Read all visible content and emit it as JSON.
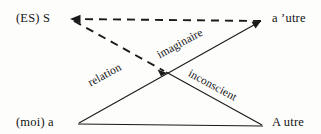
{
  "diagram": {
    "name": "lacan-l-schema",
    "background_color": "#fdfdfc",
    "line_color": "#1a1a1a",
    "vertices": {
      "top_left": "(ES) S",
      "top_right": "a ’utre",
      "bottom_left": "(moi) a",
      "bottom_right": "A utre"
    },
    "edge_labels": {
      "relation": "relation",
      "imaginaire": "imaginaire",
      "inconscient": "inconscient"
    }
  }
}
